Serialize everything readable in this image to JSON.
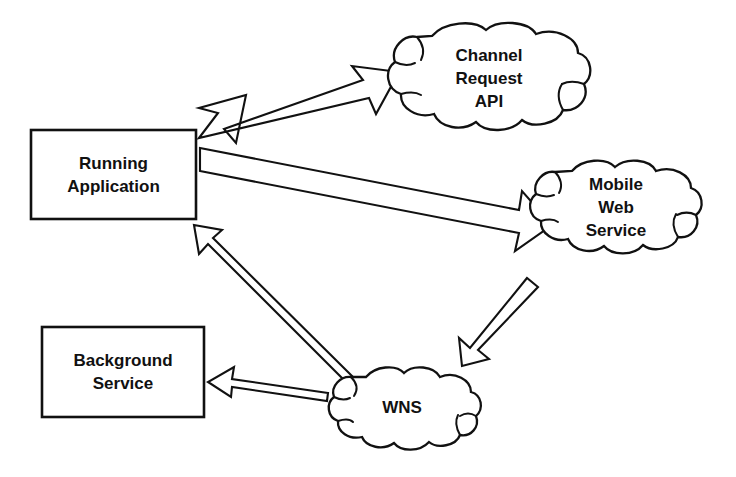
{
  "diagram": {
    "background_color": "#ffffff",
    "stroke_color": "#111111",
    "fill_color": "#ffffff",
    "nodes": [
      {
        "id": "running-application",
        "shape": "rectangle",
        "lines": [
          "Running",
          "Application"
        ],
        "x": 31,
        "y": 130,
        "width": 165,
        "height": 89,
        "font_size": 17
      },
      {
        "id": "background-service",
        "shape": "rectangle",
        "lines": [
          "Background",
          "Service"
        ],
        "x": 42,
        "y": 327,
        "width": 162,
        "height": 90,
        "font_size": 17
      },
      {
        "id": "channel-request-api",
        "shape": "cloud",
        "lines": [
          "Channel",
          "Request",
          "API"
        ],
        "x": 388,
        "y": 24,
        "width": 204,
        "height": 116,
        "font_size": 17
      },
      {
        "id": "mobile-web-service",
        "shape": "cloud",
        "lines": [
          "Mobile",
          "Web",
          "Service"
        ],
        "x": 532,
        "y": 158,
        "width": 172,
        "height": 114,
        "font_size": 17
      },
      {
        "id": "wns",
        "shape": "cloud",
        "lines": [
          "WNS"
        ],
        "x": 327,
        "y": 366,
        "width": 156,
        "height": 88,
        "font_size": 17
      }
    ],
    "connectors": [
      {
        "id": "app-to-channel-api",
        "from": "running-application",
        "to": "channel-request-api",
        "style": "double-headed-block-arrow",
        "label": ""
      },
      {
        "id": "app-to-mobile-web-service",
        "from": "running-application",
        "to": "mobile-web-service",
        "style": "block-arrow",
        "label": ""
      },
      {
        "id": "mobile-web-service-to-wns",
        "from": "mobile-web-service",
        "to": "wns",
        "style": "block-arrow",
        "label": ""
      },
      {
        "id": "wns-to-running-application",
        "from": "wns",
        "to": "running-application",
        "style": "block-arrow",
        "label": ""
      },
      {
        "id": "wns-to-background-service",
        "from": "wns",
        "to": "background-service",
        "style": "block-arrow",
        "label": ""
      }
    ]
  }
}
